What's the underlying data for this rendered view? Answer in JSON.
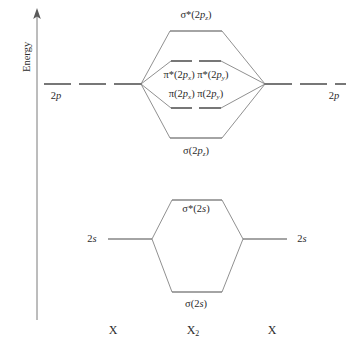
{
  "diagram": {
    "title_axis": "Energy",
    "axis": {
      "label": "Energy",
      "direction": "up",
      "x": 37,
      "top_y": 10,
      "bottom_y": 320
    },
    "species": {
      "left_atom": "X",
      "molecule_main": "X",
      "molecule_sub": "2",
      "right_atom": "X"
    },
    "atomic_orbitals": {
      "p_left": "2p",
      "p_right": "2p",
      "s_left": "2s",
      "s_right": "2s"
    },
    "molecular_orbitals": {
      "sigma_star_2pz": {
        "sigma": "σ*(2",
        "p": "p",
        "sub": "z",
        "close": ")",
        "full": "σ*(2p_z)",
        "y": 31,
        "type": "antibonding",
        "line_style": "solid"
      },
      "pi_star": {
        "full": "π*(2p_x) π*(2p_y)",
        "y": 61,
        "type": "antibonding",
        "line_style": "dashed",
        "degeneracy": 2
      },
      "pi_bonding": {
        "full": "π(2p_x) π(2p_y)",
        "y": 108,
        "type": "bonding",
        "line_style": "dashed",
        "degeneracy": 2
      },
      "sigma_2pz": {
        "full": "σ(2p_z)",
        "y": 138,
        "type": "bonding",
        "line_style": "solid"
      },
      "sigma_star_2s": {
        "full": "σ*(2s)",
        "y": 200,
        "type": "antibonding",
        "line_style": "solid"
      },
      "sigma_2s": {
        "full": "σ(2s)",
        "y": 292,
        "type": "bonding",
        "line_style": "solid"
      }
    },
    "levels": {
      "p_atomic_y": 84,
      "s_atomic_y": 239
    },
    "colors": {
      "line": "#4a4a4a",
      "correlation": "#6b6b6b",
      "text": "#2b2b2b",
      "background": "#ffffff"
    }
  }
}
